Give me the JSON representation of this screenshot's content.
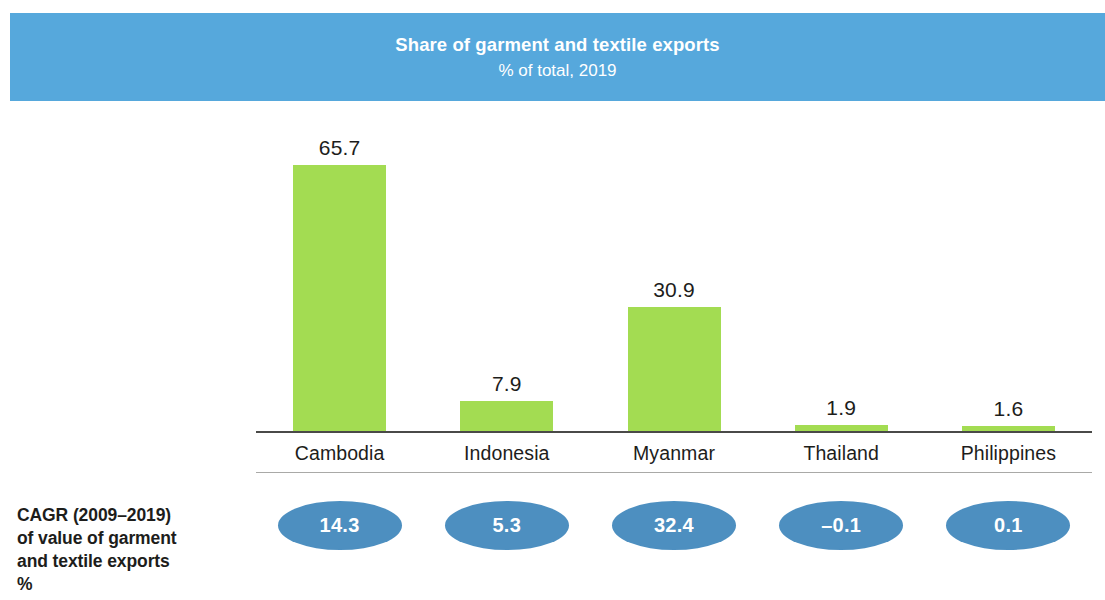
{
  "banner": {
    "title": "Share of garment and textile exports",
    "subtitle": "% of total, 2019",
    "bg_color": "#56a8dc",
    "text_color": "#ffffff"
  },
  "side_caption": {
    "line1": "CAGR (2009–2019)",
    "line2": "of value of garment",
    "line3": "and textile exports",
    "unit": "%"
  },
  "colors": {
    "bar": "#a3dc52",
    "bubble": "#4d8fc0",
    "axis": "#4a4a48",
    "axis_light": "#a9a9a7",
    "text": "#1d1d1b"
  },
  "chart_data": {
    "type": "bar",
    "title": "Share of garment and textile exports",
    "subtitle": "% of total, 2019",
    "xlabel": "",
    "ylabel": "",
    "ylim": [
      0,
      72
    ],
    "grid": false,
    "legend": "none",
    "categories": [
      "Cambodia",
      "Indonesia",
      "Myanmar",
      "Thailand",
      "Philippines"
    ],
    "values": [
      65.7,
      7.9,
      30.9,
      1.9,
      1.6
    ],
    "value_labels": [
      "65.7",
      "7.9",
      "30.9",
      "1.9",
      "1.6"
    ],
    "series": [
      {
        "name": "Share of garment and textile exports, % of total, 2019",
        "values": [
          65.7,
          7.9,
          30.9,
          1.9,
          1.6
        ]
      },
      {
        "name": "CAGR (2009–2019) of value of garment and textile exports, %",
        "values": [
          14.3,
          5.3,
          32.4,
          -0.1,
          0.1
        ],
        "labels": [
          "14.3",
          "5.3",
          "32.4",
          "–0.1",
          "0.1"
        ],
        "display": "bubble"
      }
    ]
  }
}
